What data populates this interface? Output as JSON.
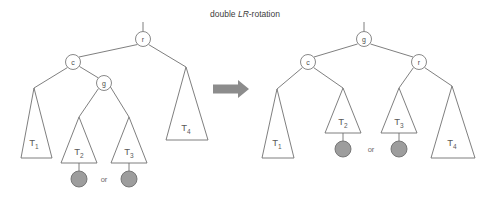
{
  "figure": {
    "title": "double LR-rotation",
    "title_prefix": "double ",
    "title_italic": "LR",
    "title_suffix": "-rotation",
    "transform_arrow": "right-arrow",
    "colors": {
      "stroke": "#707070",
      "node_fill": "#ffffff",
      "leaf_fill": "#9d9d9d",
      "leaf_stroke": "#6e6e6e",
      "arrow": "#8c8c8c",
      "text": "#4d4d4d",
      "background": "#ffffff"
    },
    "before": {
      "caption": "before rotation",
      "root_stub": true,
      "nodes": [
        {
          "id": "r",
          "label": "r",
          "cx": 143,
          "cy": 39,
          "r": 7.5
        },
        {
          "id": "c",
          "label": "c",
          "cx": 73,
          "cy": 62,
          "r": 7.5
        },
        {
          "id": "g",
          "label": "g",
          "cx": 104,
          "cy": 83,
          "r": 7.5
        }
      ],
      "subtrees": [
        {
          "id": "T1",
          "label": "T",
          "sub": "1",
          "apex_x": 34,
          "apex_y": 88,
          "base_y": 158,
          "base_left": 21,
          "base_right": 52,
          "leaf": false
        },
        {
          "id": "T2",
          "label": "T",
          "sub": "2",
          "apex_x": 79,
          "apex_y": 117,
          "base_y": 163,
          "base_left": 61,
          "base_right": 97,
          "leaf": true
        },
        {
          "id": "T3",
          "label": "T",
          "sub": "3",
          "apex_x": 129,
          "apex_y": 117,
          "base_y": 163,
          "base_left": 111,
          "base_right": 147,
          "leaf": true
        },
        {
          "id": "T4",
          "label": "T",
          "sub": "4",
          "apex_x": 186,
          "apex_y": 67,
          "base_y": 140,
          "base_left": 166,
          "base_right": 208,
          "leaf": false
        }
      ],
      "leaf_nodes": [
        {
          "parent": "T2",
          "cx": 79,
          "cy": 179,
          "r": 8
        },
        {
          "parent": "T3",
          "cx": 129,
          "cy": 179,
          "r": 8
        }
      ],
      "or_label": {
        "text": "or",
        "x": 104,
        "y": 182
      },
      "edges": [
        {
          "from": "r",
          "to": "c"
        },
        {
          "from": "r",
          "to": "T4"
        },
        {
          "from": "c",
          "to": "T1"
        },
        {
          "from": "c",
          "to": "g"
        },
        {
          "from": "g",
          "to": "T2"
        },
        {
          "from": "g",
          "to": "T3"
        }
      ]
    },
    "after": {
      "caption": "after rotation",
      "root_stub": true,
      "nodes": [
        {
          "id": "g",
          "label": "g",
          "cx": 364,
          "cy": 39,
          "r": 7.5
        },
        {
          "id": "c",
          "label": "c",
          "cx": 308,
          "cy": 62,
          "r": 7.5
        },
        {
          "id": "r",
          "label": "r",
          "cx": 419,
          "cy": 62,
          "r": 7.5
        }
      ],
      "subtrees": [
        {
          "id": "T1",
          "label": "T",
          "sub": "1",
          "apex_x": 277,
          "apex_y": 89,
          "base_y": 158,
          "base_left": 262,
          "base_right": 294,
          "leaf": false
        },
        {
          "id": "T2",
          "label": "T",
          "sub": "2",
          "apex_x": 343,
          "apex_y": 88,
          "base_y": 133,
          "base_left": 325,
          "base_right": 361,
          "leaf": true
        },
        {
          "id": "T3",
          "label": "T",
          "sub": "3",
          "apex_x": 399,
          "apex_y": 88,
          "base_y": 133,
          "base_left": 381,
          "base_right": 417,
          "leaf": true
        },
        {
          "id": "T4",
          "label": "T",
          "sub": "4",
          "apex_x": 452,
          "apex_y": 86,
          "base_y": 158,
          "base_left": 431,
          "base_right": 475,
          "leaf": false
        }
      ],
      "leaf_nodes": [
        {
          "parent": "T2",
          "cx": 343,
          "cy": 149,
          "r": 8
        },
        {
          "parent": "T3",
          "cx": 399,
          "cy": 149,
          "r": 8
        }
      ],
      "or_label": {
        "text": "or",
        "x": 371,
        "y": 152
      },
      "edges": [
        {
          "from": "g",
          "to": "c"
        },
        {
          "from": "g",
          "to": "r"
        },
        {
          "from": "c",
          "to": "T1"
        },
        {
          "from": "c",
          "to": "T2"
        },
        {
          "from": "r",
          "to": "T3"
        },
        {
          "from": "r",
          "to": "T4"
        }
      ]
    }
  }
}
